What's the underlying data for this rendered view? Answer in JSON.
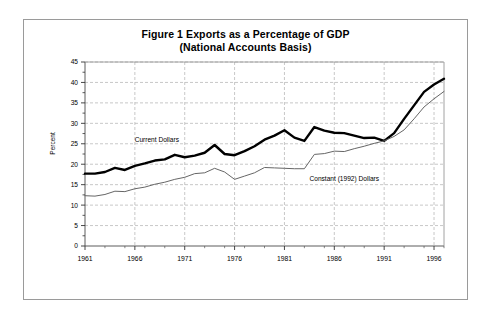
{
  "chart_data": {
    "type": "line",
    "title": "Figure 1 Exports as a Percentage of GDP",
    "subtitle": "(National Accounts Basis)",
    "xlabel": "",
    "ylabel": "Percent",
    "ylim": [
      0,
      45
    ],
    "xlim": [
      1961,
      1997
    ],
    "ytick_values": [
      0,
      5,
      10,
      15,
      20,
      25,
      30,
      35,
      40,
      45
    ],
    "ytick_labels": [
      "0",
      "5",
      "10",
      "15",
      "20",
      "25",
      "30",
      "35",
      "40",
      "45"
    ],
    "xtick_values": [
      1961,
      1966,
      1971,
      1976,
      1981,
      1986,
      1991,
      1996
    ],
    "xtick_labels": [
      "1961",
      "1966",
      "1971",
      "1976",
      "1981",
      "1986",
      "1991",
      "1996"
    ],
    "x_minor_tick_interval": 1,
    "grid": "dashed both axes",
    "legend": "inline annotations",
    "x": [
      1961,
      1962,
      1963,
      1964,
      1965,
      1966,
      1967,
      1968,
      1969,
      1970,
      1971,
      1972,
      1973,
      1974,
      1975,
      1976,
      1977,
      1978,
      1979,
      1980,
      1981,
      1982,
      1983,
      1984,
      1985,
      1986,
      1987,
      1988,
      1989,
      1990,
      1991,
      1992,
      1993,
      1994,
      1995,
      1996,
      1997
    ],
    "series": [
      {
        "name": "Current Dollars",
        "color": "#000000",
        "line_width": 2.4,
        "annotation": "Current Dollars",
        "annotation_x": 1968.2,
        "annotation_y": 25.4,
        "values": [
          17.7,
          17.7,
          18.1,
          19.1,
          18.6,
          19.6,
          20.2,
          20.9,
          21.2,
          22.3,
          21.7,
          22.1,
          22.8,
          24.7,
          22.5,
          22.2,
          23.2,
          24.4,
          26.0,
          27.0,
          28.3,
          26.5,
          25.7,
          29.1,
          28.2,
          27.7,
          27.6,
          27.0,
          26.4,
          26.5,
          25.7,
          27.6,
          31.1,
          34.4,
          37.7,
          39.5,
          40.9
        ]
      },
      {
        "name": "Constant (1992) Dollars",
        "color": "#666666",
        "line_width": 1.0,
        "annotation": "Constant (1992) Dollars",
        "annotation_x": 1987.0,
        "annotation_y": 15.8,
        "values": [
          12.3,
          12.2,
          12.6,
          13.4,
          13.3,
          14.0,
          14.4,
          15.1,
          15.6,
          16.3,
          16.8,
          17.7,
          17.9,
          19.0,
          18.1,
          16.3,
          17.1,
          17.9,
          19.2,
          19.1,
          19.0,
          18.9,
          18.9,
          22.4,
          22.6,
          23.2,
          23.1,
          23.8,
          24.4,
          25.1,
          25.7,
          26.8,
          28.4,
          31.1,
          34.0,
          36.0,
          37.8
        ]
      }
    ]
  }
}
